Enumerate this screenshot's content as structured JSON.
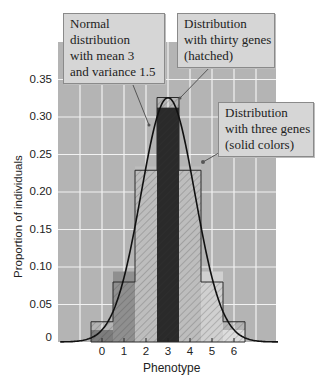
{
  "chart_data": {
    "type": "bar",
    "title": "",
    "xlabel": "Phenotype",
    "ylabel": "Proportion of individuals",
    "categories": [
      "0",
      "1",
      "2",
      "3",
      "4",
      "5",
      "6"
    ],
    "ylim": [
      0,
      0.38
    ],
    "xlim": [
      -2,
      8
    ],
    "yticks": [
      "0",
      "0.05",
      "0.10",
      "0.15",
      "0.20",
      "0.25",
      "0.30",
      "0.35"
    ],
    "grid": true,
    "series": [
      {
        "name": "Distribution with three genes (solid colors)",
        "style": "solid",
        "values": [
          0.016,
          0.094,
          0.234,
          0.3125,
          0.234,
          0.094,
          0.016
        ],
        "colors": [
          "#7d7d7d",
          "#8f8f8f",
          "#bdbdbd",
          "#2a2a2a",
          "#bdbdbd",
          "#d0d0d0",
          "#dddddd"
        ]
      },
      {
        "name": "Distribution with thirty genes (hatched)",
        "style": "hatched",
        "values": [
          0.027,
          0.08,
          0.229,
          0.326,
          0.229,
          0.08,
          0.027
        ]
      },
      {
        "name": "Normal distribution with mean 3 and variance 1.5",
        "style": "line",
        "mean": 3,
        "variance": 1.5
      }
    ],
    "annotations": [
      {
        "text": [
          "Normal",
          "distribution",
          "with mean 3",
          "and variance 1.5"
        ],
        "points_to": "normal curve"
      },
      {
        "text": [
          "Distribution",
          "with thirty genes",
          "(hatched)"
        ],
        "points_to": "hatched bars"
      },
      {
        "text": [
          "Distribution",
          "with three genes",
          "(solid colors)"
        ],
        "points_to": "solid bars"
      }
    ]
  },
  "axes": {
    "xlabel": "Phenotype",
    "ylabel": "Proportion of individuals",
    "yticks": [
      {
        "label": "0.35",
        "value": 0.35
      },
      {
        "label": "0.30",
        "value": 0.3
      },
      {
        "label": "0.25",
        "value": 0.25
      },
      {
        "label": "0.20",
        "value": 0.2
      },
      {
        "label": "0.15",
        "value": 0.15
      },
      {
        "label": "0.10",
        "value": 0.1
      },
      {
        "label": "0.05",
        "value": 0.05
      },
      {
        "label": "0",
        "value": 0
      }
    ],
    "xticks": [
      "0",
      "1",
      "2",
      "3",
      "4",
      "5",
      "6"
    ]
  },
  "callouts": {
    "normal": {
      "line1": "Normal",
      "line2": "distribution",
      "line3": "with mean 3",
      "line4": "and variance 1.5"
    },
    "thirty": {
      "line1": "Distribution",
      "line2": "with thirty genes",
      "line3": "(hatched)"
    },
    "three": {
      "line1": "Distribution",
      "line2": "with three genes",
      "line3": "(solid colors)"
    }
  },
  "colors": {
    "plot_bg": "#b4b4b4",
    "grid": "#f2f2f2",
    "curve": "#111111",
    "callout_bg": "#d6d6d6"
  }
}
